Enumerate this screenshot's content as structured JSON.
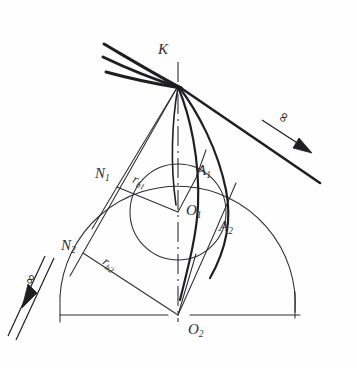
{
  "figure": {
    "type": "technical-line-drawing",
    "width": 357,
    "height": 368,
    "background_color": "#fefefe",
    "line_color": "#2e2e33",
    "thick_curve_color": "#1f1f22"
  },
  "labels": {
    "K": {
      "text": "K",
      "sub": "",
      "x": 158,
      "y": 42
    },
    "N1": {
      "text": "N",
      "sub": "1",
      "x": 95,
      "y": 166
    },
    "rb1": {
      "text": "r",
      "sub": "b1",
      "x": 133,
      "y": 174
    },
    "A1": {
      "text": "A",
      "sub": "1",
      "x": 197,
      "y": 163
    },
    "O1": {
      "text": "O",
      "sub": "1",
      "x": 186,
      "y": 203
    },
    "A2": {
      "text": "A",
      "sub": "2",
      "x": 219,
      "y": 219
    },
    "N2": {
      "text": "N",
      "sub": "2",
      "x": 61,
      "y": 238
    },
    "rb2": {
      "text": "r",
      "sub": "b2",
      "x": 103,
      "y": 257
    },
    "O2": {
      "text": "O",
      "sub": "2",
      "x": 188,
      "y": 322
    }
  },
  "infinity_markers": [
    {
      "name": "infinity-upper-right",
      "symbol": "∞",
      "x": 277,
      "y": 109,
      "rotation": -63
    },
    {
      "name": "infinity-lower-left",
      "symbol": "∞",
      "x": 24,
      "y": 271,
      "rotation": -62
    }
  ],
  "geometry": {
    "point_K": {
      "x": 178,
      "y": 86
    },
    "center_O1": {
      "x": 178,
      "y": 212
    },
    "center_O2": {
      "x": 178,
      "y": 315
    },
    "point_N1": {
      "x": 117,
      "y": 187
    },
    "point_N2": {
      "x": 83,
      "y": 253
    },
    "point_A1": {
      "x": 196,
      "y": 178
    },
    "point_A2": {
      "x": 215,
      "y": 232
    },
    "base_circle_1_radius": 48,
    "base_circle_2_radius": 117,
    "baseline_y": 315,
    "baseline_left_x": 60,
    "baseline_right_x": 300
  }
}
